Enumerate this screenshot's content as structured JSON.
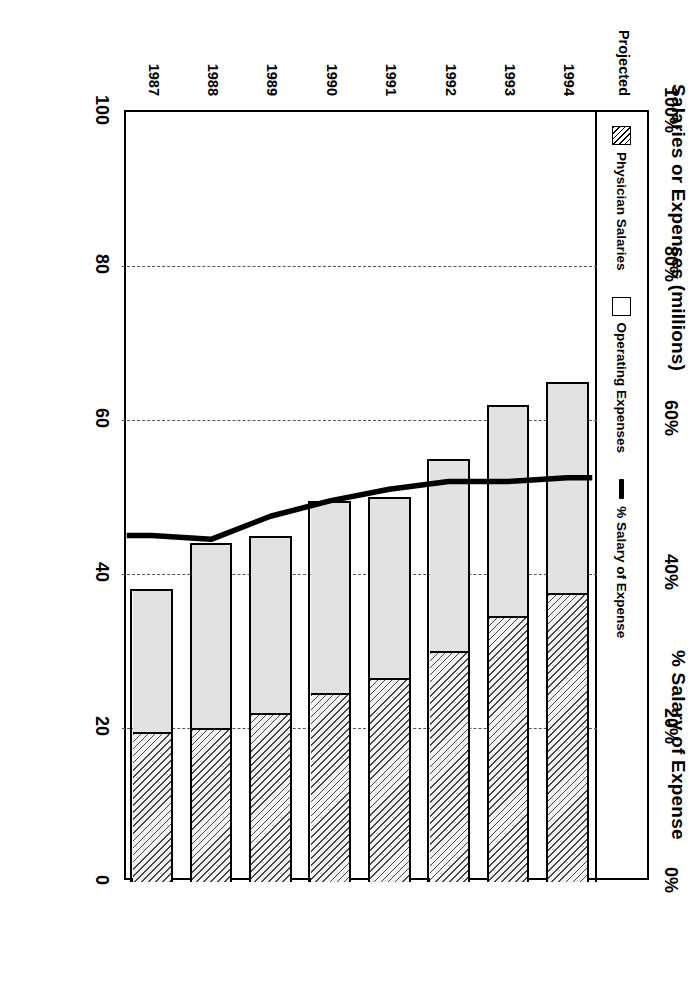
{
  "left_axis": {
    "title": "Salaries or Expenses (millions)",
    "ticks": [
      "0",
      "20",
      "40",
      "60",
      "80",
      "100"
    ],
    "values": [
      0,
      20,
      40,
      60,
      80,
      100
    ]
  },
  "right_axis": {
    "title": "% Salary of Expense",
    "ticks": [
      "0%",
      "20%",
      "40%",
      "60%",
      "80%",
      "100%"
    ],
    "values": [
      0,
      20,
      40,
      60,
      80,
      100
    ]
  },
  "legend": {
    "items": [
      {
        "label": "Physician Salaries",
        "marker": "hatch-swatch-icon"
      },
      {
        "label": "Operating Expenses",
        "marker": "open-swatch-icon"
      },
      {
        "label": "% Salary of Expense",
        "marker": "line-swatch-icon"
      }
    ]
  },
  "category_note": "Projected",
  "chart_data": {
    "type": "bar",
    "title": "",
    "subtitle": "",
    "categories": [
      "1987",
      "1988",
      "1989",
      "1990",
      "1991",
      "1992",
      "1993",
      "1994"
    ],
    "xlabel": "",
    "ylabel": "Salaries or Expenses (millions)",
    "y2label": "% Salary of Expense",
    "ylim": [
      0,
      100
    ],
    "y2lim": [
      0,
      100
    ],
    "grid": true,
    "stacked": true,
    "legend_position": "top-inside",
    "annotations": [
      "Projected"
    ],
    "series": [
      {
        "name": "Physician Salaries",
        "axis": "left",
        "kind": "bar-segment",
        "values": [
          19.5,
          20.0,
          22.0,
          24.5,
          26.5,
          30.0,
          34.5,
          37.5
        ]
      },
      {
        "name": "Operating Expenses",
        "axis": "left",
        "kind": "bar-segment",
        "values": [
          18.5,
          24.0,
          23.0,
          25.0,
          23.5,
          25.0,
          27.5,
          27.5
        ]
      },
      {
        "name": "Total Expenses",
        "axis": "left",
        "kind": "bar-total",
        "values": [
          38.0,
          44.0,
          45.0,
          49.5,
          50.0,
          55.0,
          62.0,
          65.0
        ]
      },
      {
        "name": "% Salary of Expense",
        "axis": "right",
        "kind": "line",
        "values": [
          45.0,
          44.5,
          47.5,
          49.5,
          51.0,
          52.0,
          52.0,
          52.5
        ]
      }
    ]
  }
}
